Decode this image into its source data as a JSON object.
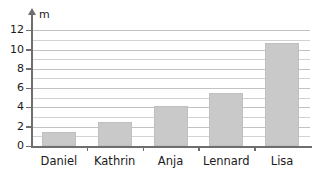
{
  "chart_data": {
    "type": "bar",
    "title": "",
    "subtitle": "",
    "xlabel": "",
    "ylabel": "m",
    "unit_label": "m",
    "categories": [
      "Daniel",
      "Kathrin",
      "Anja",
      "Lennard",
      "Lisa"
    ],
    "values": [
      1.5,
      2.5,
      4.1,
      5.5,
      10.7
    ],
    "ylim": [
      0,
      12
    ],
    "ytick_labels": [
      "0",
      "2",
      "4",
      "6",
      "8",
      "10",
      "12"
    ],
    "ytick_values": [
      0,
      2,
      4,
      6,
      8,
      10,
      12
    ],
    "minor_gridline_values": [
      1,
      3,
      5,
      7,
      9,
      11
    ],
    "grid": true,
    "legend": false,
    "legend_position": "none",
    "bar_color": "#c9c9c9",
    "axis_color": "#6e6e6e",
    "grid_color": "#d2d2d2",
    "text_color": "#1a1a1a",
    "background": "#ffffff"
  }
}
